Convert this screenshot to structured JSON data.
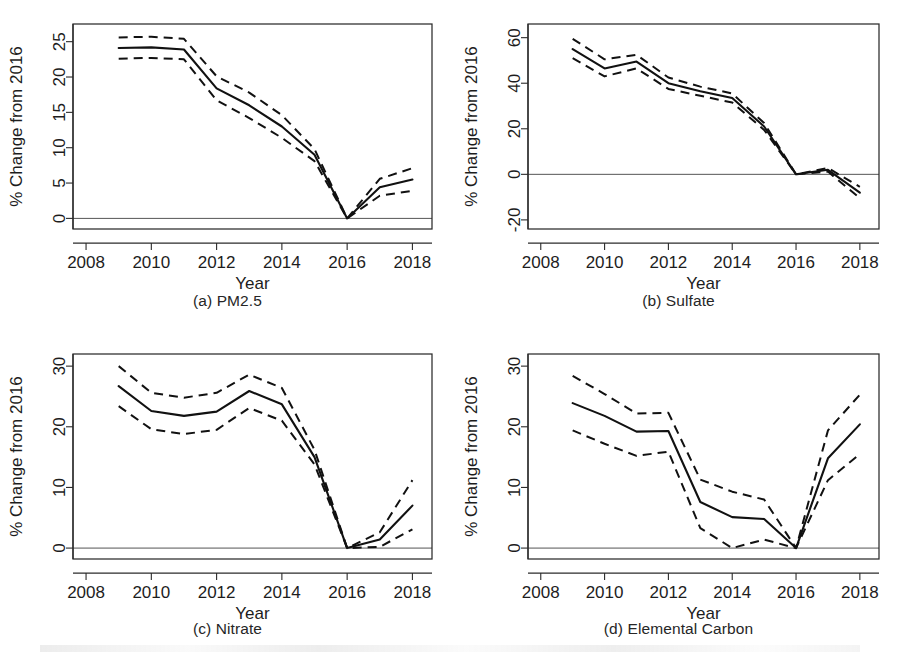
{
  "figure": {
    "axis_y_label": "% Change from 2016",
    "axis_x_label": "Year",
    "line_color": "#111111",
    "zero_line_color": "#555555"
  },
  "panels": [
    {
      "key": "a",
      "caption": "(a) PM2.5"
    },
    {
      "key": "b",
      "caption": "(b) Sulfate"
    },
    {
      "key": "c",
      "caption": "(c) Nitrate"
    },
    {
      "key": "d",
      "caption": "(d) Elemental Carbon"
    }
  ],
  "chart_data": [
    {
      "type": "line",
      "title": "(a) PM2.5",
      "xlabel": "Year",
      "ylabel": "% Change from 2016",
      "xlim": [
        2007.6,
        2018.6
      ],
      "ylim": [
        -1.5,
        27.5
      ],
      "xticks": [
        2008,
        2010,
        2012,
        2014,
        2016,
        2018
      ],
      "yticks": [
        0,
        5,
        10,
        15,
        20,
        25
      ],
      "grid": false,
      "legend": "none",
      "zero_reference_line": 0,
      "x": [
        2009,
        2010,
        2011,
        2012,
        2013,
        2014,
        2015,
        2016,
        2017,
        2018
      ],
      "series": [
        {
          "name": "estimate",
          "style": "solid",
          "values": [
            24.1,
            24.2,
            23.9,
            18.4,
            16.0,
            13.0,
            9.0,
            0.0,
            4.4,
            5.5
          ]
        },
        {
          "name": "upper_ci",
          "style": "dashed",
          "values": [
            25.6,
            25.7,
            25.4,
            20.1,
            17.8,
            14.6,
            9.8,
            0.0,
            5.6,
            7.1
          ]
        },
        {
          "name": "lower_ci",
          "style": "dashed",
          "values": [
            22.6,
            22.7,
            22.5,
            16.7,
            14.2,
            11.4,
            8.1,
            0.0,
            3.2,
            3.9
          ]
        }
      ]
    },
    {
      "type": "line",
      "title": "(b) Sulfate",
      "xlabel": "Year",
      "ylabel": "% Change from 2016",
      "xlim": [
        2007.6,
        2018.6
      ],
      "ylim": [
        -24,
        66
      ],
      "xticks": [
        2008,
        2010,
        2012,
        2014,
        2016,
        2018
      ],
      "yticks": [
        -20,
        0,
        20,
        40,
        60
      ],
      "grid": false,
      "legend": "none",
      "zero_reference_line": 0,
      "x": [
        2009,
        2010,
        2011,
        2012,
        2013,
        2014,
        2015,
        2016,
        2017,
        2018
      ],
      "series": [
        {
          "name": "estimate",
          "style": "solid",
          "values": [
            55.0,
            46.5,
            49.5,
            40.0,
            36.5,
            33.5,
            21.0,
            0.0,
            2.0,
            -8.0
          ]
        },
        {
          "name": "upper_ci",
          "style": "dashed",
          "values": [
            59.5,
            50.5,
            52.5,
            42.5,
            38.5,
            35.5,
            22.5,
            0.0,
            2.8,
            -5.5
          ]
        },
        {
          "name": "lower_ci",
          "style": "dashed",
          "values": [
            51.0,
            43.0,
            46.5,
            37.5,
            34.5,
            31.5,
            19.5,
            0.0,
            1.2,
            -10.5
          ]
        }
      ]
    },
    {
      "type": "line",
      "title": "(c) Nitrate",
      "xlabel": "Year",
      "ylabel": "% Change from 2016",
      "xlim": [
        2007.6,
        2018.6
      ],
      "ylim": [
        -1.8,
        32
      ],
      "xticks": [
        2008,
        2010,
        2012,
        2014,
        2016,
        2018
      ],
      "yticks": [
        0,
        10,
        20,
        30
      ],
      "grid": false,
      "legend": "none",
      "zero_reference_line": 0,
      "x": [
        2009,
        2010,
        2011,
        2012,
        2013,
        2014,
        2015,
        2016,
        2017,
        2018
      ],
      "series": [
        {
          "name": "estimate",
          "style": "solid",
          "values": [
            26.7,
            22.6,
            21.8,
            22.5,
            25.9,
            23.7,
            15.0,
            0.0,
            1.4,
            7.0
          ]
        },
        {
          "name": "upper_ci",
          "style": "dashed",
          "values": [
            30.0,
            25.6,
            24.8,
            25.6,
            28.6,
            26.4,
            16.2,
            0.0,
            2.6,
            11.2
          ]
        },
        {
          "name": "lower_ci",
          "style": "dashed",
          "values": [
            23.4,
            19.6,
            18.8,
            19.5,
            23.1,
            21.0,
            13.8,
            0.0,
            0.2,
            3.1
          ]
        }
      ]
    },
    {
      "type": "line",
      "title": "(d) Elemental Carbon",
      "xlabel": "Year",
      "ylabel": "% Change from 2016",
      "xlim": [
        2007.6,
        2018.6
      ],
      "ylim": [
        -1.8,
        32
      ],
      "xticks": [
        2008,
        2010,
        2012,
        2014,
        2016,
        2018
      ],
      "yticks": [
        0,
        10,
        20,
        30
      ],
      "grid": false,
      "legend": "none",
      "zero_reference_line": 0,
      "x": [
        2009,
        2010,
        2011,
        2012,
        2013,
        2014,
        2015,
        2016,
        2017,
        2018
      ],
      "series": [
        {
          "name": "estimate",
          "style": "solid",
          "values": [
            23.9,
            21.8,
            19.2,
            19.3,
            7.6,
            5.1,
            4.8,
            0.0,
            14.8,
            20.4
          ]
        },
        {
          "name": "upper_ci",
          "style": "dashed",
          "values": [
            28.4,
            25.4,
            22.2,
            22.3,
            11.3,
            9.3,
            8.0,
            0.0,
            19.4,
            25.3
          ]
        },
        {
          "name": "lower_ci",
          "style": "dashed",
          "values": [
            19.4,
            17.2,
            15.2,
            15.9,
            3.3,
            0.0,
            1.4,
            0.0,
            11.2,
            15.5
          ]
        }
      ]
    }
  ]
}
